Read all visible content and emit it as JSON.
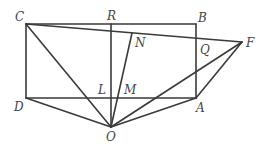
{
  "diagram": {
    "type": "geometry-figure",
    "stroke_color": "#3a3a3a",
    "label_color": "#444444",
    "points": {
      "C": {
        "label": "C",
        "x": 26,
        "y": 24
      },
      "R": {
        "label": "R",
        "x": 111,
        "y": 24
      },
      "B": {
        "label": "B",
        "x": 196,
        "y": 24
      },
      "N": {
        "label": "N",
        "x": 132,
        "y": 33
      },
      "Q": {
        "label": "Q",
        "x": 196,
        "y": 38
      },
      "F": {
        "label": "F",
        "x": 242,
        "y": 42
      },
      "D": {
        "label": "D",
        "x": 26,
        "y": 98
      },
      "L": {
        "label": "L",
        "x": 111,
        "y": 98
      },
      "M": {
        "label": "M",
        "x": 117,
        "y": 98
      },
      "A": {
        "label": "A",
        "x": 196,
        "y": 98
      },
      "O": {
        "label": "O",
        "x": 111,
        "y": 127
      }
    },
    "segments": [
      [
        "C",
        "B"
      ],
      [
        "B",
        "A"
      ],
      [
        "A",
        "D"
      ],
      [
        "D",
        "C"
      ],
      [
        "C",
        "F"
      ],
      [
        "R",
        "O"
      ],
      [
        "C",
        "O"
      ],
      [
        "D",
        "O"
      ],
      [
        "A",
        "O"
      ],
      [
        "F",
        "O"
      ],
      [
        "F",
        "A"
      ],
      [
        "N",
        "O"
      ]
    ]
  }
}
